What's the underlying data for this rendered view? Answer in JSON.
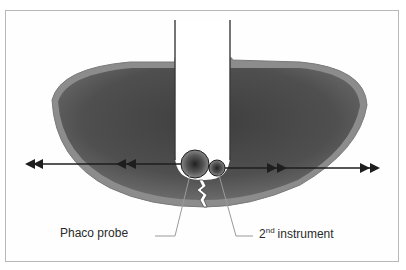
{
  "diagram": {
    "type": "phacoemulsification cross-section",
    "labels": {
      "phaco_probe": "Phaco probe",
      "second_instrument_number": "2",
      "second_instrument_suffix": "nd",
      "second_instrument_text": "instrument"
    },
    "elements": {
      "lens": "lens nucleus (dark grey ellipse with lighter capsule rim)",
      "groove": "central sculpted groove (white channel)",
      "crack": "crack at base of groove",
      "arrows_left": "double-headed arrows pointing left (separation force)",
      "arrows_right": "double-headed arrows pointing right (separation force)"
    },
    "colors": {
      "capsule": "#8a8a8a",
      "nucleus": "#5a5a5a",
      "arrow": "#1e1e1e",
      "leader_line": "#9a9a9a",
      "text": "#2a2a2a",
      "frame": "#b8b8b8"
    }
  }
}
